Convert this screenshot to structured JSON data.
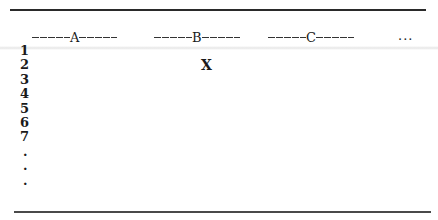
{
  "grid": {
    "columns": [
      {
        "label": "A"
      },
      {
        "label": "B"
      },
      {
        "label": "C"
      }
    ],
    "more_columns": "...",
    "rows": [
      "1",
      "2",
      "3",
      "4",
      "5",
      "6",
      "7"
    ],
    "more_rows": [
      ".",
      ".",
      "."
    ],
    "marked_cell": {
      "column": "B",
      "row": "2",
      "value": "X"
    }
  }
}
